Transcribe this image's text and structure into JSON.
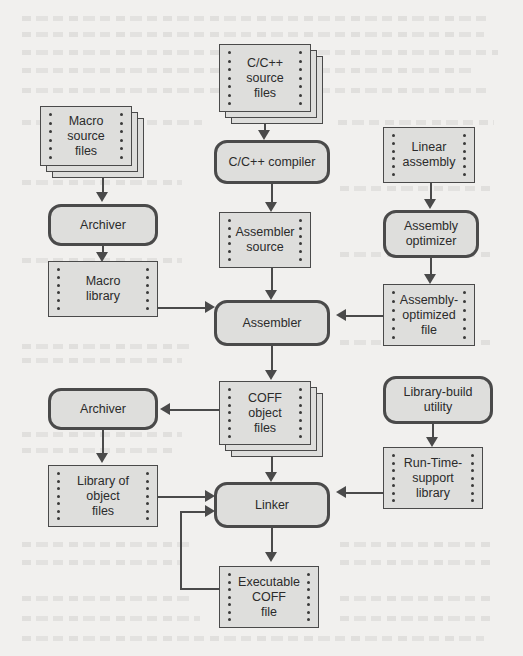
{
  "diagram": {
    "canvas": {
      "width": 523,
      "height": 656
    },
    "colors": {
      "page_background": "#f1f0ee",
      "node_fill": "#dededc",
      "stroke": "#4a4a4a",
      "text": "#2b2b2b"
    },
    "nodes": [
      {
        "id": "c-source",
        "label": "C/C++\nsource\nfiles",
        "shape": "data-stack",
        "x": 219,
        "y": 44,
        "w": 92,
        "h": 68,
        "sheets": 2
      },
      {
        "id": "macro-source",
        "label": "Macro\nsource\nfiles",
        "shape": "data-stack",
        "x": 40,
        "y": 106,
        "w": 92,
        "h": 60,
        "sheets": 2
      },
      {
        "id": "c-compiler",
        "label": "C/C++ compiler",
        "shape": "process",
        "x": 214,
        "y": 140,
        "w": 116,
        "h": 44
      },
      {
        "id": "linear-assembly",
        "label": "Linear\nassembly",
        "shape": "data",
        "x": 383,
        "y": 127,
        "w": 92,
        "h": 56
      },
      {
        "id": "archiver-macro",
        "label": "Archiver",
        "shape": "process",
        "x": 48,
        "y": 204,
        "w": 110,
        "h": 42
      },
      {
        "id": "assembler-source",
        "label": "Assembler\nsource",
        "shape": "data",
        "x": 219,
        "y": 212,
        "w": 92,
        "h": 56
      },
      {
        "id": "assembly-optimizer",
        "label": "Assembly\noptimizer",
        "shape": "process",
        "x": 383,
        "y": 210,
        "w": 96,
        "h": 48
      },
      {
        "id": "macro-library",
        "label": "Macro\nlibrary",
        "shape": "data",
        "x": 48,
        "y": 261,
        "w": 110,
        "h": 56
      },
      {
        "id": "assembly-opt-file",
        "label": "Assembly-\noptimized\nfile",
        "shape": "data",
        "x": 383,
        "y": 284,
        "w": 92,
        "h": 62
      },
      {
        "id": "assembler",
        "label": "Assembler",
        "shape": "process",
        "x": 214,
        "y": 300,
        "w": 116,
        "h": 46
      },
      {
        "id": "coff-object",
        "label": "COFF\nobject\nfiles",
        "shape": "data-stack",
        "x": 219,
        "y": 381,
        "w": 92,
        "h": 64,
        "sheets": 2
      },
      {
        "id": "library-build",
        "label": "Library-build\nutility",
        "shape": "process",
        "x": 383,
        "y": 376,
        "w": 110,
        "h": 48
      },
      {
        "id": "archiver-object",
        "label": "Archiver",
        "shape": "process",
        "x": 48,
        "y": 388,
        "w": 110,
        "h": 42
      },
      {
        "id": "runtime-library",
        "label": "Run-Time-\nsupport\nlibrary",
        "shape": "data",
        "x": 383,
        "y": 447,
        "w": 100,
        "h": 62
      },
      {
        "id": "library-objects",
        "label": "Library of\nobject\nfiles",
        "shape": "data",
        "x": 48,
        "y": 465,
        "w": 110,
        "h": 62
      },
      {
        "id": "linker",
        "label": "Linker",
        "shape": "process",
        "x": 214,
        "y": 482,
        "w": 116,
        "h": 46
      },
      {
        "id": "executable-coff",
        "label": "Executable\nCOFF\nfile",
        "shape": "data",
        "x": 219,
        "y": 566,
        "w": 100,
        "h": 62
      }
    ],
    "edges": [
      {
        "from": "c-source",
        "to": "c-compiler",
        "direction": "down"
      },
      {
        "from": "c-compiler",
        "to": "assembler-source",
        "direction": "down"
      },
      {
        "from": "assembler-source",
        "to": "assembler",
        "direction": "down"
      },
      {
        "from": "macro-source",
        "to": "archiver-macro",
        "direction": "down"
      },
      {
        "from": "archiver-macro",
        "to": "macro-library",
        "direction": "down"
      },
      {
        "from": "macro-library",
        "to": "assembler",
        "direction": "right"
      },
      {
        "from": "linear-assembly",
        "to": "assembly-optimizer",
        "direction": "down"
      },
      {
        "from": "assembly-optimizer",
        "to": "assembly-opt-file",
        "direction": "down"
      },
      {
        "from": "assembly-opt-file",
        "to": "assembler",
        "direction": "left"
      },
      {
        "from": "assembler",
        "to": "coff-object",
        "direction": "down"
      },
      {
        "from": "coff-object",
        "to": "archiver-object",
        "direction": "left"
      },
      {
        "from": "coff-object",
        "to": "linker",
        "direction": "down"
      },
      {
        "from": "archiver-object",
        "to": "library-objects",
        "direction": "down"
      },
      {
        "from": "library-objects",
        "to": "linker",
        "direction": "right"
      },
      {
        "from": "library-build",
        "to": "runtime-library",
        "direction": "down"
      },
      {
        "from": "runtime-library",
        "to": "linker",
        "direction": "left"
      },
      {
        "from": "linker",
        "to": "executable-coff",
        "direction": "down"
      },
      {
        "from": "executable-coff",
        "to": "linker",
        "direction": "feedback-left"
      }
    ]
  }
}
